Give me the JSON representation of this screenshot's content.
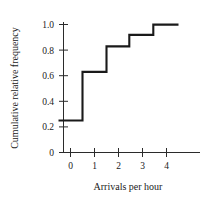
{
  "chart_data": {
    "type": "line",
    "title": "",
    "subtitle": "",
    "xlabel": "Arrivals per hour",
    "ylabel": "Cumulative relative frequency",
    "xlim": [
      -0.6,
      5.0
    ],
    "ylim": [
      0,
      1.08
    ],
    "grid": false,
    "legend": null,
    "style": "step-post",
    "line_color": "#1a1a1a",
    "x_ticks": [
      0,
      1,
      2,
      3,
      4
    ],
    "x_tick_labels": [
      "0",
      "1",
      "2",
      "3",
      "4"
    ],
    "y_ticks": [
      0,
      0.2,
      0.4,
      0.6,
      0.8,
      1.0
    ],
    "y_tick_labels": [
      "0",
      "0.2",
      "0.4",
      "0.6",
      "0.8",
      "1.0"
    ],
    "steps": [
      {
        "x_start": -0.5,
        "x_end": 0.5,
        "y": 0.25
      },
      {
        "x_start": 0.5,
        "x_end": 1.5,
        "y": 0.63
      },
      {
        "x_start": 1.5,
        "x_end": 2.45,
        "y": 0.83
      },
      {
        "x_start": 2.45,
        "x_end": 3.45,
        "y": 0.92
      },
      {
        "x_start": 3.45,
        "x_end": 4.5,
        "y": 1.0
      }
    ],
    "x": [
      -0.5,
      0.5,
      1.5,
      2.45,
      3.45,
      4.5
    ],
    "values": [
      0.25,
      0.63,
      0.83,
      0.92,
      1.0,
      1.0
    ],
    "jump_points": [
      {
        "x": 0.5,
        "from": 0.25,
        "to": 0.63
      },
      {
        "x": 1.5,
        "from": 0.63,
        "to": 0.83
      },
      {
        "x": 2.45,
        "from": 0.83,
        "to": 0.92
      },
      {
        "x": 3.45,
        "from": 0.92,
        "to": 1.0
      }
    ]
  },
  "labels": {
    "x_axis_title": "Arrivals per hour",
    "y_axis_title": "Cumulative relative frequency",
    "y_0": "0",
    "y_02": "0.2",
    "y_04": "0.4",
    "y_06": "0.6",
    "y_08": "0.8",
    "y_10": "1.0",
    "x_0": "0",
    "x_1": "1",
    "x_2": "2",
    "x_3": "3",
    "x_4": "4"
  }
}
